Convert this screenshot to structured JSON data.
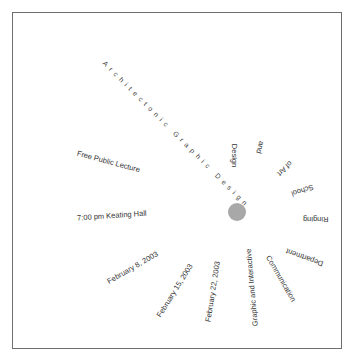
{
  "poster": {
    "title": "Architectonic Graphic Design",
    "event_type": "Free Public Lecture",
    "time_location": "7:00 pm Keating Hall",
    "dates": [
      "February 8, 2003",
      "February 15, 2003",
      "February 22, 2003"
    ],
    "organizer_words": [
      "Graphic and Interactive",
      "Communication",
      "Department",
      "Ringing",
      "School",
      "of Art",
      "and",
      "Design"
    ],
    "colors": {
      "border": "#6e6e6e",
      "dot": "#a8a8a8",
      "text": "#333333",
      "background": "#ffffff"
    }
  }
}
